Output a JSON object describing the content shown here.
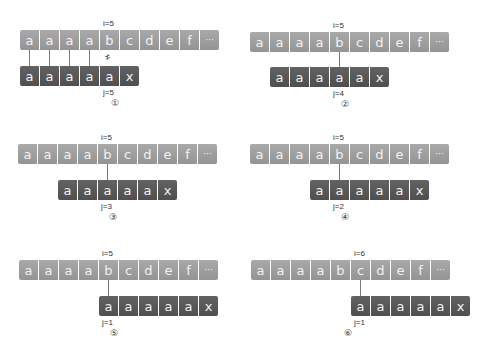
{
  "caption_cutoff": "",
  "text_string": [
    "a",
    "a",
    "a",
    "a",
    "b",
    "c",
    "d",
    "e",
    "f",
    "···"
  ],
  "pattern_string": [
    "a",
    "a",
    "a",
    "a",
    "a",
    "x"
  ],
  "colors": {
    "text_cells": "#a0a0a0",
    "pattern_cells": "#585858",
    "connector": "#7a7a7a"
  },
  "panels": [
    {
      "step": "①",
      "i_label": "i=5",
      "j_label": "j=5",
      "i": 5,
      "j": 5,
      "pattern_offset": 0,
      "matches": [
        0,
        1,
        2,
        3
      ],
      "mismatch_at": 4,
      "mismatch_symbol": "≠"
    },
    {
      "step": "②",
      "i_label": "i=5",
      "j_label": "j=4",
      "i": 5,
      "j": 4,
      "pattern_offset": 1,
      "compare_at": 4
    },
    {
      "step": "③",
      "i_label": "i=5",
      "j_label": "j=3",
      "i": 5,
      "j": 3,
      "pattern_offset": 2,
      "compare_at": 4
    },
    {
      "step": "④",
      "i_label": "i=5",
      "j_label": "j=2",
      "i": 5,
      "j": 2,
      "pattern_offset": 3,
      "compare_at": 4
    },
    {
      "step": "⑤",
      "i_label": "i=5",
      "j_label": "j=1",
      "i": 5,
      "j": 1,
      "pattern_offset": 4,
      "compare_at": 4
    },
    {
      "step": "⑥",
      "i_label": "i=6",
      "j_label": "j=1",
      "i": 6,
      "j": 1,
      "pattern_offset": 5,
      "compare_at": 5
    }
  ]
}
